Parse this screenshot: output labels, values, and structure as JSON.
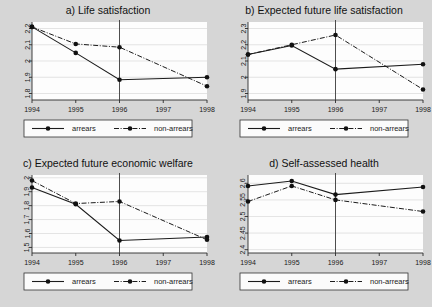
{
  "figure": {
    "background_color": "#d6d6d6",
    "plot_background_color": "#fdfdfd",
    "line_color": "#1b1b1b",
    "grid_color": "#d9d9d9",
    "reference_line_year": "1996"
  },
  "legend": {
    "arrears_label": "arrears",
    "non_arrears_label": "non-arrears"
  },
  "bottom_text": "",
  "chart_data": [
    {
      "id": "panel-a",
      "type": "line",
      "title": "a) Life satisfaction",
      "xlabel": "",
      "ylabel": "",
      "x": [
        1994,
        1995,
        1996,
        1998
      ],
      "xtick_labels": [
        "1994",
        "1995",
        "1996",
        "1997",
        "1998"
      ],
      "xlim": [
        1994,
        1998
      ],
      "ylim": [
        1.76,
        2.24
      ],
      "yticks": [
        1.8,
        1.9,
        2,
        2.1,
        2.2
      ],
      "ytick_labels": [
        "1.8",
        "1.9",
        "2",
        "2.1",
        "2.2"
      ],
      "grid": true,
      "legend_position": "below",
      "vline": 1996,
      "series": [
        {
          "name": "arrears",
          "style": "solid",
          "values": [
            2.21,
            2.05,
            1.885,
            1.9
          ]
        },
        {
          "name": "non-arrears",
          "style": "dash-dot",
          "values": [
            2.21,
            2.105,
            2.085,
            1.845
          ]
        }
      ]
    },
    {
      "id": "panel-b",
      "type": "line",
      "title": "b) Expected future life satisfaction",
      "xlabel": "",
      "ylabel": "",
      "x": [
        1994,
        1995,
        1996,
        1998
      ],
      "xtick_labels": [
        "1994",
        "1995",
        "1996",
        "1997",
        "1998"
      ],
      "xlim": [
        1994,
        1998
      ],
      "ylim": [
        1.86,
        2.34
      ],
      "yticks": [
        1.9,
        2,
        2.1,
        2.2,
        2.3
      ],
      "ytick_labels": [
        "1.9",
        "2",
        "2.1",
        "2.2",
        "2.3"
      ],
      "grid": true,
      "legend_position": "below",
      "vline": 1996,
      "series": [
        {
          "name": "arrears",
          "style": "solid",
          "values": [
            2.14,
            2.195,
            2.05,
            2.08
          ]
        },
        {
          "name": "non-arrears",
          "style": "dash-dot",
          "values": [
            2.14,
            2.2,
            2.26,
            1.925
          ]
        }
      ]
    },
    {
      "id": "panel-c",
      "type": "line",
      "title": "c) Expected future economic welfare",
      "xlabel": "",
      "ylabel": "",
      "x": [
        1994,
        1995,
        1996,
        1998
      ],
      "xtick_labels": [
        "1994",
        "1995",
        "1996",
        "1997",
        "1998"
      ],
      "xlim": [
        1994,
        1998
      ],
      "ylim": [
        1.46,
        2.02
      ],
      "yticks": [
        1.5,
        1.6,
        1.7,
        1.8,
        1.9,
        2
      ],
      "ytick_labels": [
        "1.5",
        "1.6",
        "1.7",
        "1.8",
        "1.9",
        "2"
      ],
      "grid": true,
      "legend_position": "below",
      "vline": 1996,
      "series": [
        {
          "name": "arrears",
          "style": "solid",
          "values": [
            1.93,
            1.81,
            1.55,
            1.575
          ]
        },
        {
          "name": "non-arrears",
          "style": "dash-dot",
          "values": [
            1.98,
            1.815,
            1.83,
            1.555
          ]
        }
      ]
    },
    {
      "id": "panel-d",
      "type": "line",
      "title": "d) Self-assessed health",
      "xlabel": "",
      "ylabel": "",
      "x": [
        1994,
        1995,
        1996,
        1998
      ],
      "xtick_labels": [
        "1994",
        "1995",
        "1996",
        "1997",
        "1998"
      ],
      "xlim": [
        1994,
        1998
      ],
      "ylim": [
        2.39,
        2.625
      ],
      "yticks": [
        2.4,
        2.45,
        2.5,
        2.55,
        2.6
      ],
      "ytick_labels": [
        "2.4",
        "2.45",
        "2.5",
        "2.55",
        "2.6"
      ],
      "grid": true,
      "legend_position": "below",
      "vline": 1996,
      "series": [
        {
          "name": "arrears",
          "style": "solid",
          "values": [
            2.592,
            2.607,
            2.566,
            2.589
          ]
        },
        {
          "name": "non-arrears",
          "style": "dash-dot",
          "values": [
            2.545,
            2.592,
            2.55,
            2.515
          ]
        }
      ]
    }
  ]
}
